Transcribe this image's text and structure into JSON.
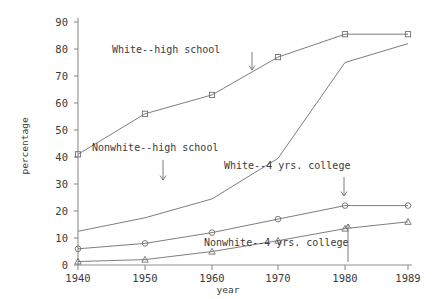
{
  "chart_data": {
    "type": "line",
    "title": "",
    "xlabel": "year",
    "ylabel": "percentage",
    "x": [
      1940,
      1950,
      1960,
      1970,
      1980,
      1989
    ],
    "xtick_labels": [
      "1940",
      "1950",
      "1960",
      "1970",
      "1980",
      "1989"
    ],
    "ytick_labels": [
      "0",
      "10",
      "20",
      "30",
      "40",
      "50",
      "60",
      "70",
      "80",
      "90"
    ],
    "ytick_values": [
      0,
      10,
      20,
      30,
      40,
      50,
      60,
      70,
      80,
      90
    ],
    "ylim": [
      -2,
      93
    ],
    "xlim": [
      1936,
      1992
    ],
    "grid": false,
    "legend": "annotations-inline",
    "series": [
      {
        "name": "White--high school",
        "marker": "square",
        "values": [
          41,
          56,
          63,
          77,
          85.5,
          85.5
        ]
      },
      {
        "name": "Nonwhite--high school",
        "marker": "none",
        "values": [
          12.5,
          17.5,
          24.5,
          39.5,
          75,
          82
        ]
      },
      {
        "name": "White--4 yrs. college",
        "marker": "circle",
        "values": [
          6,
          8,
          12,
          17,
          22,
          22
        ]
      },
      {
        "name": "Nonwhite--4 yrs. college",
        "marker": "triangle",
        "values": [
          1.3,
          2,
          5,
          9,
          13.5,
          16
        ]
      }
    ],
    "annotations": [
      {
        "id": "white-high-school",
        "text": "White--high school",
        "label_x": 112,
        "label_y": 53,
        "arrow": {
          "x1": 252,
          "y1": 52,
          "x2": 252,
          "y2": 70,
          "dir": "down"
        }
      },
      {
        "id": "nonwhite-high-school",
        "text": "Nonwhite--high school",
        "label_x": 92,
        "label_y": 151,
        "arrow": {
          "x1": 163,
          "y1": 160,
          "x2": 163,
          "y2": 180,
          "dir": "down"
        }
      },
      {
        "id": "white-4yrs-college",
        "text": "White--4 yrs. college",
        "label_x": 224,
        "label_y": 169,
        "arrow": {
          "x1": 344,
          "y1": 177,
          "x2": 344,
          "y2": 196,
          "dir": "down"
        }
      },
      {
        "id": "nonwhite-4yrs-college",
        "text": "Nonwhite--4 yrs. college",
        "label_x": 204,
        "label_y": 246,
        "arrow": {
          "x1": 348,
          "y1": 262,
          "x2": 348,
          "y2": 224,
          "dir": "up"
        }
      }
    ]
  },
  "axis": {
    "ylabel": "percentage",
    "xlabel": "year"
  }
}
